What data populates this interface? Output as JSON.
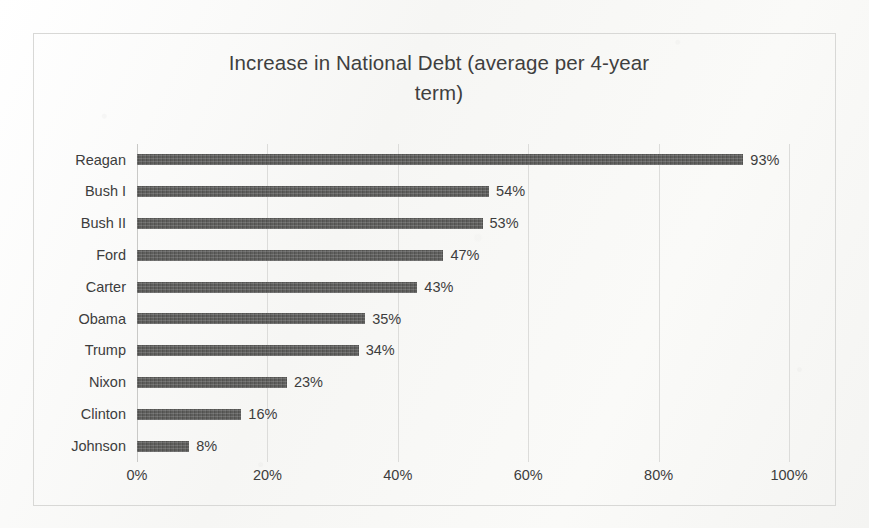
{
  "chart_data": {
    "type": "bar",
    "orientation": "horizontal",
    "title": "Increase in National Debt (average per 4-year\nterm)",
    "xlabel": "",
    "ylabel": "",
    "xlim": [
      0,
      100
    ],
    "grid": true,
    "legend": false,
    "x_ticks": [
      "0%",
      "20%",
      "40%",
      "60%",
      "80%",
      "100%"
    ],
    "x_tick_values": [
      0,
      20,
      40,
      60,
      80,
      100
    ],
    "categories": [
      "Reagan",
      "Bush I",
      "Bush II",
      "Ford",
      "Carter",
      "Obama",
      "Trump",
      "Nixon",
      "Clinton",
      "Johnson"
    ],
    "values": [
      93,
      54,
      53,
      47,
      43,
      35,
      34,
      23,
      16,
      8
    ],
    "data_labels": [
      "93%",
      "54%",
      "53%",
      "47%",
      "43%",
      "35%",
      "34%",
      "23%",
      "16%",
      "8%"
    ],
    "bar_color": "#585856",
    "text_color": "#3d3d3d",
    "gridline_color": "#dcdcda",
    "frame_border_color": "#d8d8d6",
    "background_color": "#fbfbfa"
  }
}
